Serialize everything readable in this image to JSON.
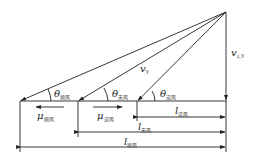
{
  "diagram": {
    "type": "wind-vector-triangle",
    "colors": {
      "line": "#222222",
      "background": "#ffffff"
    },
    "labels": {
      "vertical_velocity": {
        "symbol": "v",
        "subscript": "z,Y"
      },
      "fall_velocity": {
        "symbol": "v",
        "subscript": "Y"
      },
      "theta_headwind": {
        "symbol": "θ",
        "subscript": "顺风"
      },
      "theta_no_wind": {
        "symbol": "θ",
        "subscript": "无风"
      },
      "theta_tailwind": {
        "symbol": "θ",
        "subscript": "逆风"
      },
      "mu_headwind": {
        "symbol": "μ",
        "subscript": "顺风"
      },
      "mu_tailwind": {
        "symbol": "μ",
        "subscript": "逆风"
      },
      "l_tailwind": {
        "symbol": "l",
        "subscript": "逆风"
      },
      "l_no_wind": {
        "symbol": "l",
        "subscript": "无风"
      },
      "l_headwind": {
        "symbol": "l",
        "subscript": "顺风"
      }
    }
  }
}
